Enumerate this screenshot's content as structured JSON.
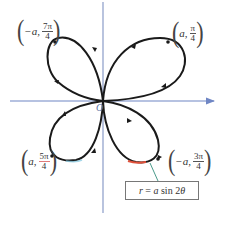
{
  "diagram": {
    "type": "polar-rose",
    "equation": "r = a sin 2θ",
    "equation_parts": {
      "lhs": "r",
      "eq": " = ",
      "coef": "a",
      "fn": " sin 2",
      "var": "θ"
    },
    "origin_label": "O",
    "colors": {
      "curve": "#1a1a1a",
      "axis": "#6f86c4",
      "callout_line": "#4a9a8a",
      "highlight": "#e0503a",
      "box_border": "#777777"
    },
    "points": [
      {
        "id": "q1",
        "r": "a",
        "num": "π",
        "den": "4",
        "display": "(a, π/4)"
      },
      {
        "id": "q2",
        "r": "−a",
        "num": "7π",
        "den": "4",
        "display": "(−a, 7π/4)"
      },
      {
        "id": "q3",
        "r": "a",
        "num": "5π",
        "den": "4",
        "display": "(a, 5π/4)"
      },
      {
        "id": "q4",
        "r": "−a",
        "num": "3π",
        "den": "4",
        "display": "(−a, 3π/4)"
      }
    ]
  }
}
